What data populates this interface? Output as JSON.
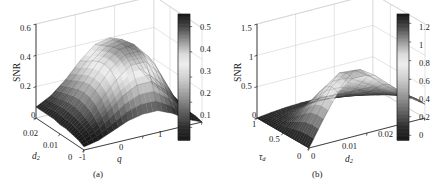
{
  "figure": {
    "background": "#ffffff",
    "ink": "#1a1a1a",
    "frame_color": "#c9c9c9"
  },
  "panels": [
    {
      "id": "a",
      "caption": "(a)",
      "zaxis": {
        "label": "SNR",
        "ticks": [
          "0",
          "0.2",
          "0.4",
          "0.6"
        ],
        "range": [
          0,
          0.6
        ]
      },
      "xaxis": {
        "label": "d",
        "sub": "2",
        "ticks": [
          "0.02",
          "0.01",
          "0"
        ],
        "range": [
          0.02,
          0
        ]
      },
      "yaxis": {
        "label": "q",
        "sub": "",
        "ticks": [
          "-1",
          "0",
          "1"
        ],
        "range": [
          -1,
          1
        ]
      },
      "colorbar": {
        "ticks": [
          "0.1",
          "0.2",
          "0.3",
          "0.4",
          "0.5"
        ],
        "range": [
          0.05,
          0.55
        ]
      }
    },
    {
      "id": "b",
      "caption": "(b)",
      "zaxis": {
        "label": "SNR",
        "ticks": [
          "0",
          "0.5",
          "1",
          "1.5"
        ],
        "range": [
          0,
          1.5
        ]
      },
      "xaxis": {
        "label": "τ",
        "sub": "d",
        "ticks": [
          "1",
          "0.5",
          "0"
        ],
        "range": [
          1,
          0
        ]
      },
      "yaxis": {
        "label": "d",
        "sub": "2",
        "ticks": [
          "0",
          "0.01",
          "0.02"
        ],
        "range": [
          0,
          0.02
        ]
      },
      "colorbar": {
        "ticks": [
          "0",
          "0.2",
          "0.4",
          "0.6",
          "0.8",
          "1",
          "1.2"
        ],
        "range": [
          -0.05,
          1.3
        ]
      }
    }
  ],
  "chart_data": [
    {
      "type": "surface",
      "panel": "a",
      "title": "",
      "xlabel": "d_2",
      "ylabel": "q",
      "zlabel": "SNR",
      "xlim": [
        0.02,
        0
      ],
      "ylim": [
        -1,
        1
      ],
      "zlim": [
        0,
        0.6
      ],
      "colorbar_lim": [
        0.05,
        0.55
      ],
      "grid": true,
      "legend": "none",
      "description": "SNR surface versus d_2 and q; broad ridge rising from a low plateau at q near -1 to a crest of about 0.45 at q around 0 then falling to near zero at q = 1; amplitude largest for small d_2.",
      "x": [
        0.02,
        0.0175,
        0.015,
        0.0125,
        0.01,
        0.0075,
        0.005,
        0.0025,
        0
      ],
      "y": [
        -1,
        -0.75,
        -0.5,
        -0.25,
        0,
        0.25,
        0.5,
        0.75,
        1
      ],
      "z": [
        [
          0.07,
          0.12,
          0.2,
          0.3,
          0.38,
          0.4,
          0.33,
          0.16,
          0.03
        ],
        [
          0.07,
          0.13,
          0.22,
          0.32,
          0.4,
          0.42,
          0.34,
          0.16,
          0.03
        ],
        [
          0.07,
          0.14,
          0.24,
          0.35,
          0.42,
          0.44,
          0.35,
          0.16,
          0.03
        ],
        [
          0.07,
          0.15,
          0.26,
          0.37,
          0.44,
          0.45,
          0.36,
          0.16,
          0.02
        ],
        [
          0.06,
          0.15,
          0.27,
          0.38,
          0.45,
          0.46,
          0.36,
          0.15,
          0.02
        ],
        [
          0.06,
          0.14,
          0.26,
          0.37,
          0.44,
          0.44,
          0.34,
          0.14,
          0.02
        ],
        [
          0.05,
          0.12,
          0.23,
          0.33,
          0.4,
          0.4,
          0.3,
          0.12,
          0.01
        ],
        [
          0.04,
          0.09,
          0.17,
          0.25,
          0.3,
          0.3,
          0.22,
          0.08,
          0.01
        ],
        [
          0.02,
          0.04,
          0.08,
          0.12,
          0.14,
          0.14,
          0.1,
          0.04,
          0.0
        ]
      ]
    },
    {
      "type": "surface",
      "panel": "b",
      "title": "",
      "xlabel": "tau_d",
      "ylabel": "d_2",
      "zlabel": "SNR",
      "xlim": [
        1,
        0
      ],
      "ylim": [
        0,
        0.02
      ],
      "zlim": [
        0,
        1.5
      ],
      "colorbar_lim": [
        -0.05,
        1.3
      ],
      "grid": true,
      "legend": "none",
      "description": "SNR surface versus tau_d and d_2; sharp ridge peaking at about 0.95 for small tau_d and intermediate d_2, decaying to near zero at large tau_d and at both d_2 extremes.",
      "x": [
        1,
        0.875,
        0.75,
        0.625,
        0.5,
        0.375,
        0.25,
        0.125,
        0
      ],
      "y": [
        0,
        0.0025,
        0.005,
        0.0075,
        0.01,
        0.0125,
        0.015,
        0.0175,
        0.02
      ],
      "z": [
        [
          0.0,
          0.03,
          0.05,
          0.06,
          0.06,
          0.05,
          0.04,
          0.03,
          0.02
        ],
        [
          0.0,
          0.05,
          0.09,
          0.11,
          0.11,
          0.09,
          0.07,
          0.05,
          0.03
        ],
        [
          0.0,
          0.08,
          0.16,
          0.19,
          0.19,
          0.16,
          0.12,
          0.08,
          0.05
        ],
        [
          0.0,
          0.13,
          0.26,
          0.32,
          0.31,
          0.26,
          0.19,
          0.13,
          0.08
        ],
        [
          0.0,
          0.21,
          0.41,
          0.5,
          0.49,
          0.41,
          0.3,
          0.2,
          0.12
        ],
        [
          0.0,
          0.3,
          0.58,
          0.71,
          0.7,
          0.58,
          0.43,
          0.29,
          0.17
        ],
        [
          0.0,
          0.38,
          0.74,
          0.9,
          0.88,
          0.74,
          0.54,
          0.36,
          0.21
        ],
        [
          0.0,
          0.41,
          0.8,
          0.96,
          0.95,
          0.8,
          0.59,
          0.39,
          0.23
        ],
        [
          0.0,
          0.4,
          0.77,
          0.93,
          0.92,
          0.77,
          0.57,
          0.38,
          0.22
        ]
      ]
    }
  ]
}
